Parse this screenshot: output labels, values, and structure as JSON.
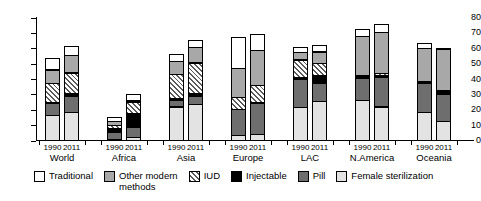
{
  "chart_data": {
    "type": "bar",
    "stacked": true,
    "title": "",
    "xlabel": "",
    "ylabel": "",
    "ylim": [
      0,
      80
    ],
    "yticks": [
      0,
      10,
      20,
      30,
      40,
      50,
      60,
      70,
      80
    ],
    "grid": false,
    "legend_position": "bottom",
    "categories": [
      "World 1990",
      "World 2011",
      "Africa 1990",
      "Africa 2011",
      "Asia 1990",
      "Asia 2011",
      "Europe 1990",
      "Europe 2011",
      "LAC 1990",
      "LAC 2011",
      "N.America 1990",
      "N.America 2011",
      "Oceania 1990",
      "Oceania 2011"
    ],
    "groups": [
      {
        "name": "World",
        "years": [
          "1990",
          "2011"
        ]
      },
      {
        "name": "Africa",
        "years": [
          "1990",
          "2011"
        ]
      },
      {
        "name": "Asia",
        "years": [
          "1990",
          "2011"
        ]
      },
      {
        "name": "Europe",
        "years": [
          "1990",
          "2011"
        ]
      },
      {
        "name": "LAC",
        "years": [
          "1990",
          "2011"
        ]
      },
      {
        "name": "N.America",
        "years": [
          "1990",
          "2011"
        ]
      },
      {
        "name": "Oceania",
        "years": [
          "1990",
          "2011"
        ]
      }
    ],
    "series": [
      {
        "name": "Female sterilization",
        "key": "fem",
        "color": "#e3e3e3",
        "pattern": "solid",
        "values": [
          17,
          19,
          1.5,
          2.5,
          22.5,
          24,
          4,
          4.5,
          22,
          26,
          26.5,
          22.5,
          19,
          13
        ]
      },
      {
        "name": "Pill",
        "key": "pill",
        "color": "#6e6e6e",
        "pattern": "solid",
        "values": [
          8,
          11,
          5,
          7.5,
          5,
          6,
          17.5,
          21,
          19,
          12.5,
          15,
          20,
          19,
          18
        ]
      },
      {
        "name": "Injectable",
        "key": "inj",
        "color": "#000000",
        "pattern": "solid",
        "values": [
          1,
          2,
          3,
          9,
          0.5,
          2,
          0,
          0,
          1,
          5.5,
          0.5,
          1,
          0.5,
          2
        ]
      },
      {
        "name": "IUD",
        "key": "iud",
        "color": "#ffffff",
        "pattern": "diagonal-hatch",
        "values": [
          13,
          14,
          2.5,
          8,
          16,
          20.5,
          8,
          12,
          12,
          8,
          1.5,
          2,
          1,
          1
        ]
      },
      {
        "name": "Other modern methods",
        "key": "other",
        "color": "#a8a8a8",
        "pattern": "solid",
        "values": [
          9,
          12,
          3,
          0.5,
          9,
          10.5,
          19.5,
          23,
          5.5,
          8,
          26,
          27,
          21.5,
          27.5
        ]
      },
      {
        "name": "Traditional",
        "key": "trad",
        "color": "#ffffff",
        "pattern": "solid",
        "values": [
          8,
          6,
          3,
          4.5,
          5,
          5,
          20.5,
          11,
          3.5,
          5,
          5,
          6,
          4,
          1
        ]
      }
    ],
    "totals": [
      56,
      64,
      18,
      32,
      58,
      68,
      69.5,
      71.5,
      63,
      65,
      74.5,
      78.5,
      65,
      62.5
    ],
    "stack_order": [
      "fem",
      "pill",
      "inj",
      "iud",
      "other",
      "trad"
    ],
    "legend": [
      {
        "label": "Traditional",
        "key": "trad",
        "swatch": "sw-trad"
      },
      {
        "label": "Other modern\nmethods",
        "key": "other",
        "swatch": "sw-other"
      },
      {
        "label": "IUD",
        "key": "iud",
        "swatch": "sw-iud"
      },
      {
        "label": "Injectable",
        "key": "inj",
        "swatch": "sw-inj"
      },
      {
        "label": "Pill",
        "key": "pill",
        "swatch": "sw-pill"
      },
      {
        "label": "Female sterilization",
        "key": "fem",
        "swatch": "sw-fem"
      }
    ]
  }
}
